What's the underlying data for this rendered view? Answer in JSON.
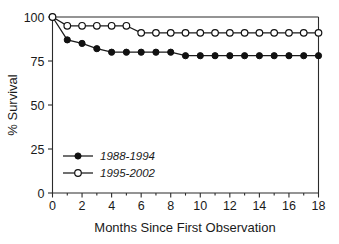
{
  "chart_data": {
    "type": "line",
    "title": "",
    "xlabel": "Months Since First Observation",
    "ylabel": "% Survival",
    "xlim": [
      0,
      18
    ],
    "ylim": [
      0,
      100
    ],
    "xticks": [
      0,
      2,
      4,
      6,
      8,
      10,
      12,
      14,
      16,
      18
    ],
    "yticks": [
      0,
      25,
      50,
      75,
      100
    ],
    "xtick_labels": [
      "0",
      "2",
      "4",
      "6",
      "8",
      "10",
      "12",
      "14",
      "16",
      "18"
    ],
    "ytick_labels": [
      "0",
      "25",
      "50",
      "75",
      "100"
    ],
    "x_minor_ticks": [
      1,
      3,
      5,
      7,
      9,
      11,
      13,
      15,
      17
    ],
    "grid": false,
    "legend_position": "lower-left-inside",
    "x": [
      0,
      1,
      2,
      3,
      4,
      5,
      6,
      7,
      8,
      9,
      10,
      11,
      12,
      13,
      14,
      15,
      16,
      17,
      18
    ],
    "series": [
      {
        "name": "1988-1994",
        "marker": "filled-circle",
        "color": "#111111",
        "values": [
          100,
          87,
          85,
          82,
          80,
          80,
          80,
          80,
          80,
          78,
          78,
          78,
          78,
          78,
          78,
          78,
          78,
          78,
          78
        ]
      },
      {
        "name": "1995-2002",
        "marker": "open-circle",
        "color": "#111111",
        "values": [
          100,
          95,
          95,
          95,
          95,
          95,
          91,
          91,
          91,
          91,
          91,
          91,
          91,
          91,
          91,
          91,
          91,
          91,
          91
        ]
      }
    ]
  },
  "legend": {
    "entries": [
      {
        "label": "1988-1994",
        "marker": "filled-circle"
      },
      {
        "label": "1995-2002",
        "marker": "open-circle"
      }
    ]
  },
  "colors": {
    "axis": "#2b2b2b",
    "text": "#1a1a1a",
    "marker_fill_filled": "#111111",
    "marker_fill_open": "#ffffff",
    "background": "#ffffff"
  }
}
